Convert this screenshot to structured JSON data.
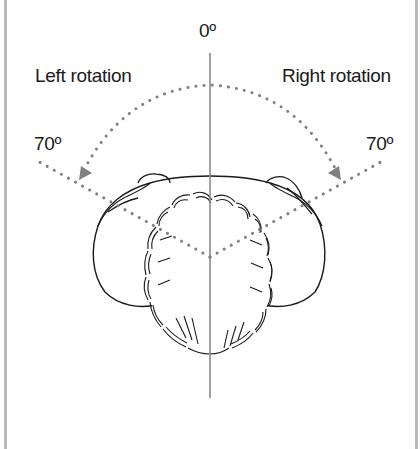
{
  "diagram": {
    "labels": {
      "zero": "0º",
      "left_rotation": "Left rotation",
      "right_rotation": "Right rotation",
      "left_angle": "70º",
      "right_angle": "70º"
    },
    "angles": {
      "neutral_deg": 0,
      "left_max_deg": 70,
      "right_max_deg": 70
    },
    "colors": {
      "dots": "#808080",
      "outline": "#1a1a1a",
      "axis": "#8a8a8a",
      "frame": "#b9b9b9",
      "background": "#ffffff"
    },
    "figure": "head-and-shoulders-viewed-from-above"
  }
}
